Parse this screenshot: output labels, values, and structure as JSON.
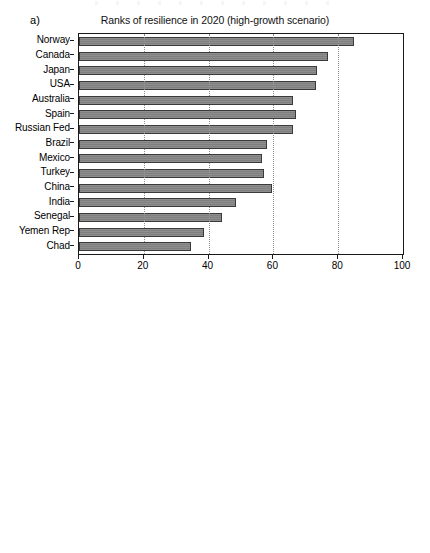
{
  "figure": {
    "panels": [
      {
        "letter": "a)",
        "title": "Ranks of resilience in 2020 (high-growth scenario)"
      },
      {
        "letter": "b)",
        "title": "Ranks of resilience in 2050 (high-growth scenario)"
      }
    ]
  },
  "chart_data": [
    {
      "type": "bar",
      "orientation": "horizontal",
      "title": "Ranks of resilience in 2020 (high-growth scenario)",
      "panel_label": "a)",
      "xlabel": "",
      "ylabel": "",
      "xlim": [
        0,
        100
      ],
      "xticks": [
        0,
        20,
        40,
        60,
        80,
        100
      ],
      "xtick_labels": [
        "0",
        "20",
        "40",
        "60",
        "80",
        "100"
      ],
      "grid": "vertical-dotted",
      "legend": "none",
      "bar_color": "#8e8e8e",
      "bar_edge_color": "#3a3a3a",
      "categories": [
        "Norway",
        "Canada",
        "Japan",
        "USA",
        "Australia",
        "Spain",
        "Russian Fed",
        "Brazil",
        "Mexico",
        "Turkey",
        "China",
        "India",
        "Senegal",
        "Yemen Rep",
        "Chad"
      ],
      "values": [
        85,
        77,
        73.5,
        73,
        66,
        67,
        66,
        58,
        56.5,
        57,
        59.5,
        48.5,
        44,
        38.5,
        34.5
      ]
    },
    {
      "type": "bar",
      "orientation": "horizontal",
      "title": "Ranks of resilience in 2050 (high-growth scenario)",
      "panel_label": "b)",
      "xlabel": "",
      "ylabel": "",
      "xlim": [
        0,
        100
      ],
      "xticks": [
        0,
        20,
        40,
        60,
        80,
        100
      ],
      "xtick_labels": [
        "0",
        "20",
        "40",
        "60",
        "80",
        "100"
      ],
      "grid": "vertical-dotted",
      "legend": "none",
      "bar_color": "#8e8e8e",
      "bar_edge_color": "#3a3a3a",
      "categories": [
        "Norway",
        "Canada",
        "Japan",
        "USA",
        "Australia",
        "Spain",
        "Russian Fed",
        "Brazil",
        "Mexico",
        "Turkey",
        "China",
        "India",
        "Senegal",
        "Yemen Rep",
        "Chad"
      ],
      "values": [
        84.5,
        76.5,
        74.5,
        73.5,
        63,
        66,
        75.5,
        61,
        58.5,
        56.5,
        66.5,
        53.5,
        51.5,
        43.5,
        41
      ]
    }
  ]
}
